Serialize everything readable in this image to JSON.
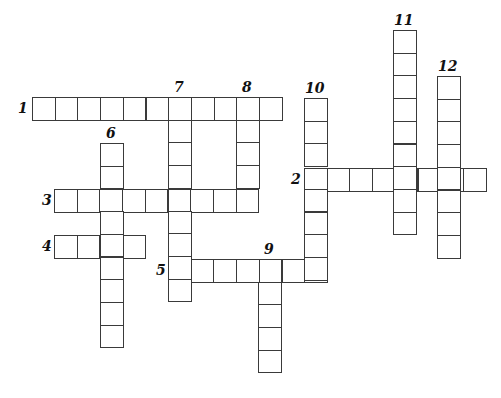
{
  "puzzle": {
    "type": "crossword",
    "cell_size": 22.7,
    "line_color": "#3a3a3a",
    "entries": [
      {
        "number": "1",
        "direction": "across",
        "x": 32,
        "y": 97,
        "length": 11,
        "label_x": 18,
        "label_y": 101
      },
      {
        "number": "2",
        "direction": "across",
        "x": 304,
        "y": 168,
        "length": 8,
        "label_x": 291,
        "label_y": 172
      },
      {
        "number": "3",
        "direction": "across",
        "x": 54,
        "y": 189,
        "length": 9,
        "label_x": 42,
        "label_y": 193
      },
      {
        "number": "4",
        "direction": "across",
        "x": 54,
        "y": 235,
        "length": 4,
        "label_x": 42,
        "label_y": 239
      },
      {
        "number": "5",
        "direction": "across",
        "x": 168,
        "y": 259,
        "length": 7,
        "label_x": 156,
        "label_y": 263
      },
      {
        "number": "6",
        "direction": "down",
        "x": 100,
        "y": 143,
        "length": 9,
        "label_x": 106,
        "label_y": 126
      },
      {
        "number": "7",
        "direction": "down",
        "x": 168,
        "y": 97,
        "length": 9,
        "label_x": 174,
        "label_y": 80
      },
      {
        "number": "8",
        "direction": "down",
        "x": 236,
        "y": 97,
        "length": 5,
        "label_x": 242,
        "label_y": 80
      },
      {
        "number": "9",
        "direction": "down",
        "x": 258,
        "y": 259,
        "length": 5,
        "label_x": 264,
        "label_y": 242
      },
      {
        "number": "10",
        "direction": "down",
        "x": 304,
        "y": 98,
        "length": 8,
        "label_x": 305,
        "label_y": 81
      },
      {
        "number": "11",
        "direction": "down",
        "x": 393,
        "y": 30,
        "length": 9,
        "label_x": 394,
        "label_y": 13
      },
      {
        "number": "12",
        "direction": "down",
        "x": 437,
        "y": 76,
        "length": 8,
        "label_x": 438,
        "label_y": 59
      }
    ]
  }
}
